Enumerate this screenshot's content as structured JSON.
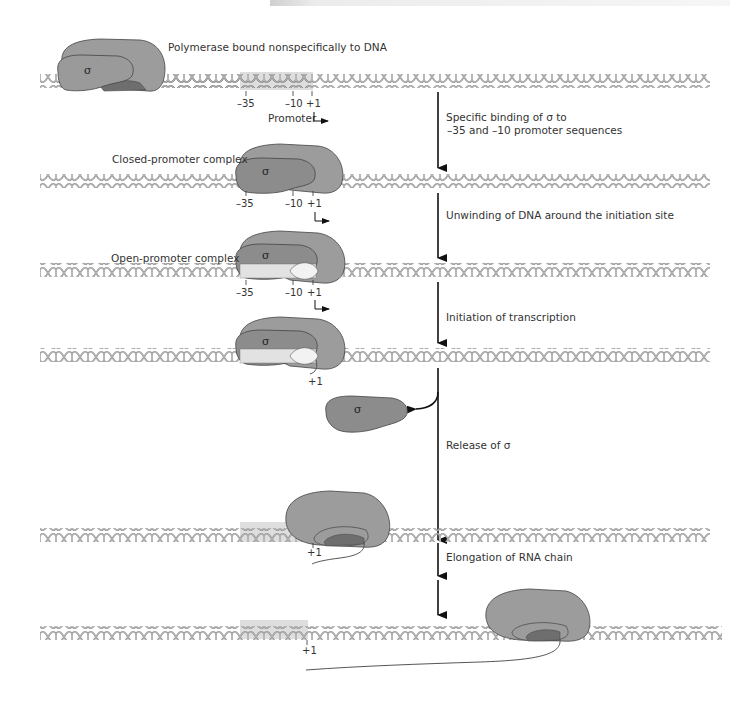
{
  "figure": {
    "colors": {
      "polymerase": "#9a9a9a",
      "sigma": "#8a8a8a",
      "core_inner": "#6f6f6f",
      "promoter_highlight": "#dcdcdc",
      "open_bubble": "#e8e8e8",
      "dna": "#7a7a7a",
      "arrow": "#111111",
      "text": "#333333"
    },
    "dna_rows_y": [
      57,
      155,
      244,
      329,
      526,
      630
    ]
  },
  "stages": [
    {
      "id": "nonspecific",
      "label": "Polymerase bound nonspecifically to DNA",
      "sigma_symbol": "σ",
      "positions": [
        "–35",
        "–10",
        "+1"
      ],
      "promoter_label": "Promoter"
    },
    {
      "id": "closed",
      "label": "Closed-promoter complex",
      "sigma_symbol": "σ",
      "positions": [
        "–35",
        "–10",
        "+1"
      ]
    },
    {
      "id": "open",
      "label": "Open-promoter complex",
      "sigma_symbol": "σ",
      "positions": [
        "–35",
        "–10",
        "+1"
      ]
    },
    {
      "id": "initiation",
      "sigma_symbol": "σ",
      "positions": [
        "+1"
      ]
    },
    {
      "id": "released-sigma",
      "sigma_symbol": "σ"
    },
    {
      "id": "elongation-early",
      "positions": [
        "+1"
      ]
    },
    {
      "id": "elongation-late",
      "positions": [
        "+1"
      ]
    }
  ],
  "steps": [
    {
      "line1": "Specific binding of σ to",
      "line2": "–35 and –10 promoter sequences"
    },
    {
      "line1": "Unwinding of DNA around the initiation site"
    },
    {
      "line1": "Initiation of transcription"
    },
    {
      "line1": "Release of σ"
    },
    {
      "line1": "Elongation of RNA chain"
    }
  ]
}
